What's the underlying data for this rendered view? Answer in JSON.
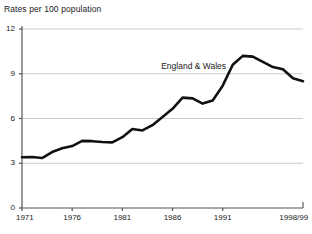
{
  "chart_data": {
    "type": "line",
    "title": "Rates per 100 population",
    "xlabel": "",
    "ylabel": "Rates per 100 population",
    "ylim": [
      0,
      12
    ],
    "yticks": [
      0,
      3,
      6,
      9,
      12
    ],
    "ytick_labels": [
      "0",
      "3",
      "6",
      "9",
      "12"
    ],
    "xlim": [
      1971,
      1999
    ],
    "xticks": [
      1971,
      1976,
      1981,
      1986,
      1991,
      1999
    ],
    "xtick_labels": [
      "1971",
      "1976",
      "1981",
      "1986",
      "1991",
      "1998/99"
    ],
    "grid": "horizontal",
    "legend_position": "inline-annotation",
    "annotations": [
      {
        "text": "England & Wales",
        "x": 1988.1,
        "y": 9.55
      }
    ],
    "series": [
      {
        "name": "England & Wales",
        "color": "#111111",
        "x": [
          1971,
          1972,
          1973,
          1974,
          1975,
          1976,
          1977,
          1978,
          1979,
          1980,
          1981,
          1982,
          1983,
          1984,
          1985,
          1986,
          1987,
          1988,
          1989,
          1990,
          1991,
          1992,
          1993,
          1994,
          1995,
          1996,
          1997,
          1998,
          1999
        ],
        "values": [
          3.4,
          3.42,
          3.35,
          3.75,
          4.0,
          4.15,
          4.5,
          4.48,
          4.42,
          4.4,
          4.75,
          5.3,
          5.2,
          5.55,
          6.1,
          6.65,
          7.4,
          7.35,
          7.0,
          7.2,
          8.2,
          9.6,
          10.2,
          10.15,
          9.8,
          9.45,
          9.3,
          8.7,
          8.5
        ]
      }
    ]
  },
  "ytick_positions": [
    {
      "label": "12",
      "value": 12
    },
    {
      "label": "9",
      "value": 9
    },
    {
      "label": "6",
      "value": 6
    },
    {
      "label": "3",
      "value": 3
    },
    {
      "label": "0",
      "value": 0
    }
  ],
  "xtick_positions": [
    {
      "label": "1971",
      "value": 1971
    },
    {
      "label": "1976",
      "value": 1976
    },
    {
      "label": "1981",
      "value": 1981
    },
    {
      "label": "1986",
      "value": 1986
    },
    {
      "label": "1991",
      "value": 1991
    },
    {
      "label": "1998/99",
      "value": 1999
    }
  ],
  "colors": {
    "line": "#111111",
    "grid": "#c9c9c9",
    "axis": "#555555",
    "text": "#1a1a1a",
    "background": "#ffffff"
  }
}
